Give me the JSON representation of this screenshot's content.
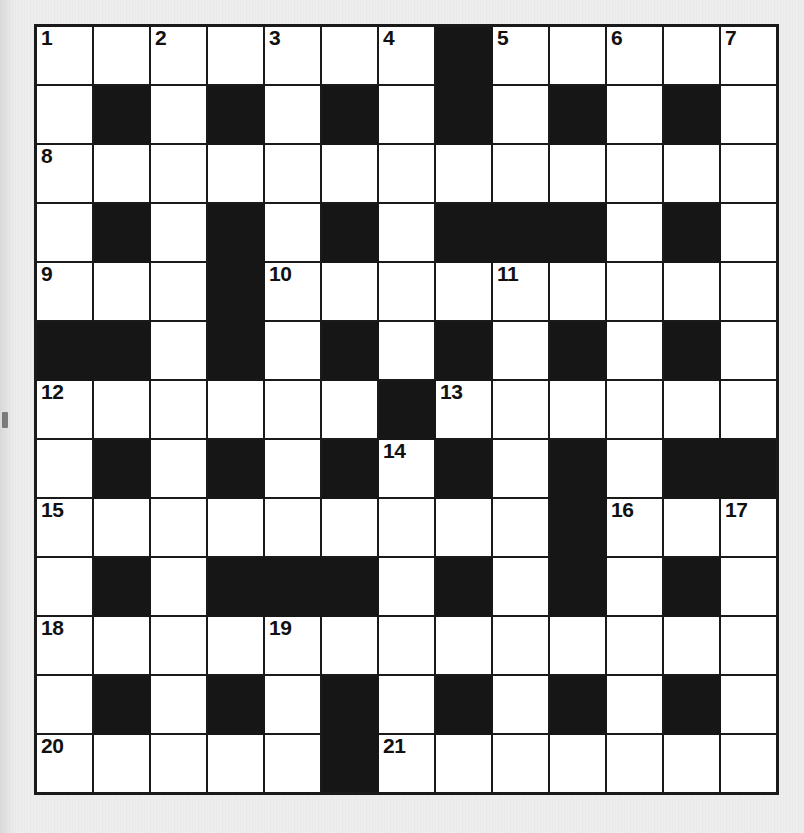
{
  "puzzle": {
    "type": "crossword-grid",
    "rows": 13,
    "columns": 13,
    "colors": {
      "block": "#161616",
      "cell": "#ffffff",
      "border": "#1a1a1a",
      "background": "#ededed",
      "number_text": "#111111"
    },
    "clue_numbers_present": [
      1,
      2,
      3,
      4,
      5,
      6,
      7,
      8,
      9,
      10,
      11,
      12,
      13,
      14,
      15,
      16,
      17,
      18,
      19,
      20,
      21
    ],
    "max_clue_number": 21,
    "grid": [
      [
        "white",
        "white",
        "white",
        "white",
        "white",
        "white",
        "white",
        "block",
        "white",
        "white",
        "white",
        "white",
        "white"
      ],
      [
        "white",
        "block",
        "white",
        "block",
        "white",
        "block",
        "white",
        "block",
        "white",
        "block",
        "white",
        "block",
        "white"
      ],
      [
        "white",
        "white",
        "white",
        "white",
        "white",
        "white",
        "white",
        "white",
        "white",
        "white",
        "white",
        "white",
        "white"
      ],
      [
        "white",
        "block",
        "white",
        "block",
        "white",
        "block",
        "white",
        "block",
        "block",
        "block",
        "white",
        "block",
        "white"
      ],
      [
        "white",
        "white",
        "white",
        "block",
        "white",
        "white",
        "white",
        "white",
        "white",
        "white",
        "white",
        "white",
        "white"
      ],
      [
        "block",
        "block",
        "white",
        "block",
        "white",
        "block",
        "white",
        "block",
        "white",
        "block",
        "white",
        "block",
        "white"
      ],
      [
        "white",
        "white",
        "white",
        "white",
        "white",
        "white",
        "block",
        "white",
        "white",
        "white",
        "white",
        "white",
        "white"
      ],
      [
        "white",
        "block",
        "white",
        "block",
        "white",
        "block",
        "white",
        "block",
        "white",
        "block",
        "white",
        "block",
        "block"
      ],
      [
        "white",
        "white",
        "white",
        "white",
        "white",
        "white",
        "white",
        "white",
        "white",
        "block",
        "white",
        "white",
        "white"
      ],
      [
        "white",
        "block",
        "white",
        "block",
        "block",
        "block",
        "white",
        "block",
        "white",
        "block",
        "white",
        "block",
        "white"
      ],
      [
        "white",
        "white",
        "white",
        "white",
        "white",
        "white",
        "white",
        "white",
        "white",
        "white",
        "white",
        "white",
        "white"
      ],
      [
        "white",
        "block",
        "white",
        "block",
        "white",
        "block",
        "white",
        "block",
        "white",
        "block",
        "white",
        "block",
        "white"
      ],
      [
        "white",
        "white",
        "white",
        "white",
        "white",
        "block",
        "white",
        "white",
        "white",
        "white",
        "white",
        "white",
        "white"
      ]
    ],
    "numbers": [
      {
        "row": 1,
        "col": 1,
        "number": "1"
      },
      {
        "row": 1,
        "col": 3,
        "number": "2"
      },
      {
        "row": 1,
        "col": 5,
        "number": "3"
      },
      {
        "row": 1,
        "col": 7,
        "number": "4"
      },
      {
        "row": 1,
        "col": 9,
        "number": "5"
      },
      {
        "row": 1,
        "col": 11,
        "number": "6"
      },
      {
        "row": 1,
        "col": 13,
        "number": "7"
      },
      {
        "row": 3,
        "col": 1,
        "number": "8"
      },
      {
        "row": 5,
        "col": 1,
        "number": "9"
      },
      {
        "row": 5,
        "col": 5,
        "number": "10"
      },
      {
        "row": 5,
        "col": 9,
        "number": "11"
      },
      {
        "row": 7,
        "col": 1,
        "number": "12"
      },
      {
        "row": 7,
        "col": 8,
        "number": "13"
      },
      {
        "row": 8,
        "col": 7,
        "number": "14"
      },
      {
        "row": 9,
        "col": 1,
        "number": "15"
      },
      {
        "row": 9,
        "col": 11,
        "number": "16"
      },
      {
        "row": 9,
        "col": 13,
        "number": "17"
      },
      {
        "row": 11,
        "col": 1,
        "number": "18"
      },
      {
        "row": 11,
        "col": 5,
        "number": "19"
      },
      {
        "row": 13,
        "col": 1,
        "number": "20"
      },
      {
        "row": 13,
        "col": 7,
        "number": "21"
      }
    ]
  }
}
